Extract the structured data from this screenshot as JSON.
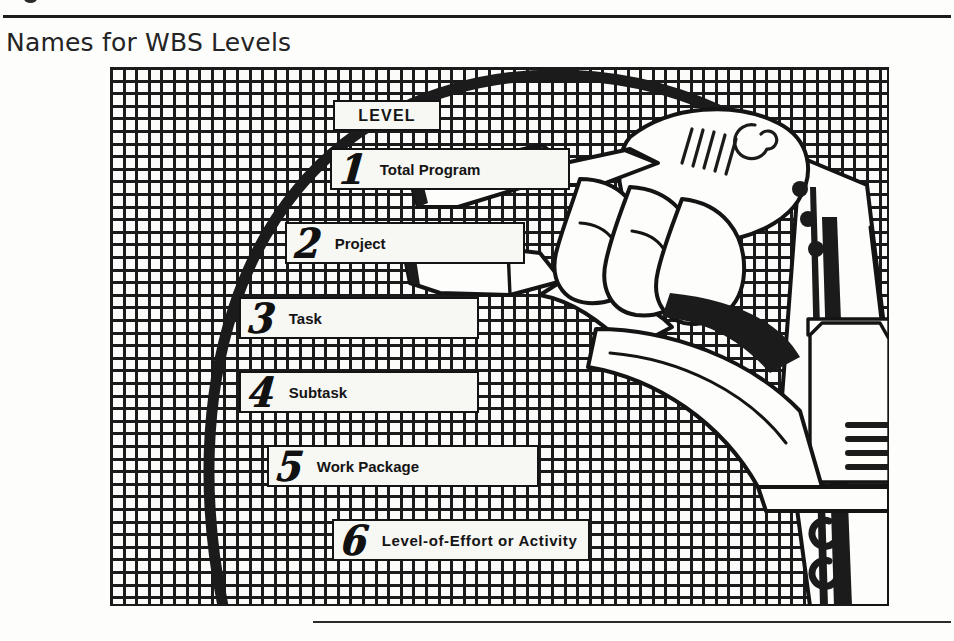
{
  "page": {
    "title": "Names for WBS Levels",
    "background_color": "#fdfdfc",
    "ink_color": "#1b1b1b"
  },
  "figure": {
    "name": "wbs-levels-illustration",
    "grid": {
      "cell_size_px": 12.6,
      "line_color": "#1b1b1b",
      "fill_color": "#fbfbf9"
    },
    "arc": {
      "color": "#1b1b1b",
      "stroke_width": 11
    },
    "header": {
      "label": "LEVEL"
    },
    "levels": [
      {
        "number": "1",
        "label": "Total Program"
      },
      {
        "number": "2",
        "label": "Project"
      },
      {
        "number": "3",
        "label": "Task"
      },
      {
        "number": "4",
        "label": "Subtask"
      },
      {
        "number": "5",
        "label": "Work Package"
      },
      {
        "number": "6",
        "label": "Level-of-Effort or Activity"
      }
    ]
  }
}
